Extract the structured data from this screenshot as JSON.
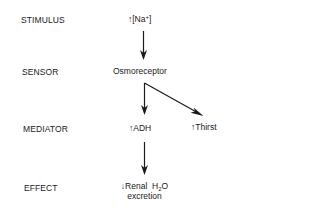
{
  "stages": [
    {
      "label": "STIMULUS"
    },
    {
      "label": "SENSOR"
    },
    {
      "label": "MEDIATOR"
    },
    {
      "label": "EFFECT"
    }
  ],
  "nodes": {
    "stimulus": {
      "arrow": "↑",
      "text_pre": "[Na",
      "superscript": "+",
      "text_post": "]"
    },
    "sensor": {
      "text": "Osmoreceptor"
    },
    "mediator_adh": {
      "arrow": "↑",
      "text": "ADH"
    },
    "mediator_thirst": {
      "arrow": "↑",
      "text": "Thirst"
    },
    "effect": {
      "arrow": "↓",
      "line1_pre": "Renal  H",
      "subscript": "2",
      "line1_post": "O",
      "line2": "excretion"
    }
  },
  "colors": {
    "ink": "#1a1a1a",
    "background": "#ffffff"
  }
}
